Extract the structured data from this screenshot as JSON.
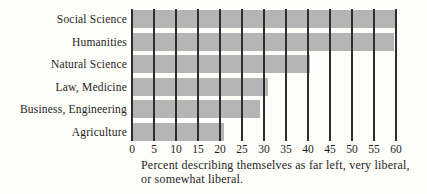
{
  "chart_data": {
    "type": "bar",
    "orientation": "horizontal",
    "title": "",
    "categories": [
      "Social Science",
      "Humanities",
      "Natural Science",
      "Law, Medicine",
      "Business, Engineering",
      "Agriculture"
    ],
    "values": [
      60,
      59.5,
      40.5,
      31,
      29,
      21
    ],
    "x_ticks": [
      "0",
      "5",
      "10",
      "15",
      "20",
      "25",
      "30",
      "35",
      "40",
      "45",
      "50",
      "55",
      "60"
    ],
    "xlim": [
      0,
      60
    ],
    "xlabel_line1": "Percent describing themselves as far left, very liberal,",
    "xlabel_line2": "or somewhat liberal.",
    "grid": "vertical-gridlines-over-bars",
    "legend": "none",
    "colors": {
      "bar": "#b5b5b5",
      "gridline": "#2e2e2e",
      "text": "#1f1f1f",
      "background": "#fdfdfa"
    }
  }
}
